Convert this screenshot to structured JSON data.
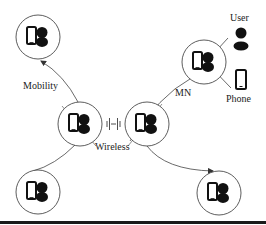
{
  "diagram": {
    "labels": {
      "mobility": "Mobility",
      "wireless": "Wireless",
      "mn": "MN",
      "user": "User",
      "phone": "Phone"
    },
    "nodes": [
      {
        "id": "node-top-left",
        "cx": 38,
        "cy": 37,
        "r": 22
      },
      {
        "id": "node-center-left",
        "cx": 80,
        "cy": 124,
        "r": 22
      },
      {
        "id": "node-center-right",
        "cx": 147,
        "cy": 124,
        "r": 22
      },
      {
        "id": "node-mn",
        "cx": 204,
        "cy": 62,
        "r": 22
      },
      {
        "id": "node-bottom-left",
        "cx": 38,
        "cy": 192,
        "r": 22
      },
      {
        "id": "node-bottom-right",
        "cx": 219,
        "cy": 193,
        "r": 22
      }
    ],
    "edges": [
      {
        "from": "node-center-left",
        "to": "node-top-left",
        "arrow": true,
        "label": "mobility"
      },
      {
        "from": "node-center-left",
        "to": "node-bottom-left",
        "arrow": false
      },
      {
        "from": "node-center-left",
        "to": "node-center-right",
        "style": "wireless-signal",
        "label": "wireless"
      },
      {
        "from": "node-center-right",
        "to": "node-mn",
        "arrow": false,
        "label": "mn"
      },
      {
        "from": "node-center-right",
        "to": "node-bottom-right",
        "arrow": true
      },
      {
        "from": "node-mn",
        "to": "user-icon",
        "arrow": false
      },
      {
        "from": "node-mn",
        "to": "phone-icon",
        "arrow": false
      }
    ],
    "colors": {
      "stroke": "#333333",
      "fill": "#1a1a1a",
      "background": "#ffffff"
    }
  }
}
